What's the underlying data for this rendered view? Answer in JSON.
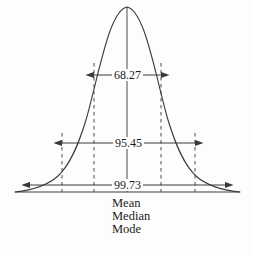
{
  "figure": {
    "background_color": "#fdfdfd",
    "stroke_color": "#3a3a3a",
    "text_color": "#1c1c1c",
    "measurements": [
      {
        "name": "one-sigma",
        "label": "68.27",
        "from_x": 94,
        "to_x": 161,
        "y": 75
      },
      {
        "name": "two-sigma",
        "label": "95.45",
        "from_x": 62,
        "to_x": 195,
        "y": 143
      },
      {
        "name": "three-sigma",
        "label": "99.73",
        "from_x": 30,
        "to_x": 225,
        "y": 185
      }
    ],
    "center_labels": [
      {
        "label": "Mean"
      },
      {
        "label": "Median"
      },
      {
        "label": "Mode"
      }
    ]
  },
  "chart_data": {
    "type": "line",
    "title": "",
    "subtitle": "",
    "xlabel": "",
    "ylabel": "",
    "curve": "normal-distribution-bell-curve",
    "grid": false,
    "legend": null,
    "baseline_y": 192,
    "peak": {
      "x": 127,
      "y": 7
    },
    "xlim": [
      15,
      240
    ],
    "markers": {
      "center_line_x": 127,
      "one_sigma_x": [
        94,
        161
      ],
      "two_sigma_x": [
        62,
        195
      ],
      "three_sigma_x": [
        30,
        225
      ]
    },
    "categories": [
      "68.27",
      "95.45",
      "99.73"
    ],
    "values": [
      68.27,
      95.45,
      99.73
    ],
    "annotations": [
      {
        "text": "68.27",
        "meaning": "percent within one standard deviation"
      },
      {
        "text": "95.45",
        "meaning": "percent within two standard deviations"
      },
      {
        "text": "99.73",
        "meaning": "percent within three standard deviations"
      },
      {
        "text": "Mean",
        "meaning": "center of distribution"
      },
      {
        "text": "Median",
        "meaning": "center of distribution"
      },
      {
        "text": "Mode",
        "meaning": "center of distribution"
      }
    ]
  }
}
